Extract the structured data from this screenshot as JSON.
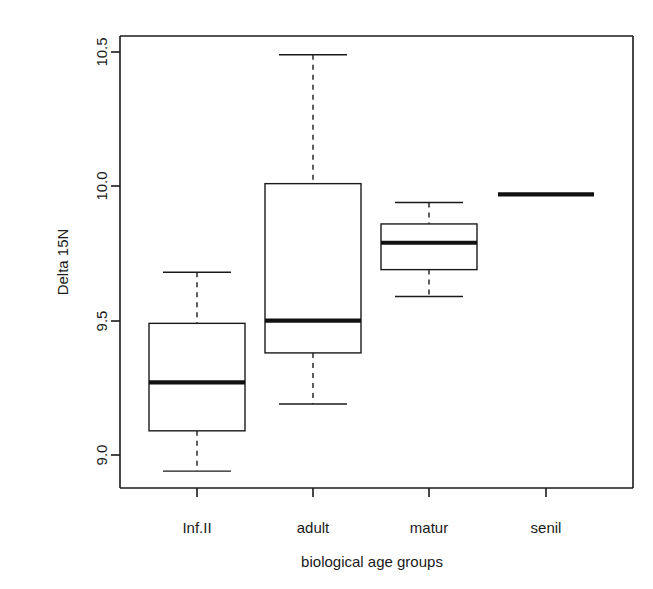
{
  "chart_data": {
    "type": "box",
    "title": "",
    "xlabel": "biological age groups",
    "ylabel": "Delta 15N",
    "categories": [
      "Inf.II",
      "adult",
      "matur",
      "senil"
    ],
    "ylim": [
      8.85,
      10.56
    ],
    "yticks": [
      9.0,
      9.5,
      10.0,
      10.5
    ],
    "ytick_labels": [
      "9.0",
      "9.5",
      "10.0",
      "10.5"
    ],
    "grid": false,
    "legend": null,
    "boxes": [
      {
        "category": "Inf.II",
        "whisker_low": 8.94,
        "q1": 9.09,
        "median": 9.27,
        "q3": 9.49,
        "whisker_high": 9.68,
        "degenerate": false
      },
      {
        "category": "adult",
        "whisker_low": 9.19,
        "q1": 9.38,
        "median": 9.5,
        "q3": 10.01,
        "whisker_high": 10.49,
        "degenerate": false
      },
      {
        "category": "matur",
        "whisker_low": 9.59,
        "q1": 9.69,
        "median": 9.79,
        "q3": 9.86,
        "whisker_high": 9.94,
        "degenerate": false
      },
      {
        "category": "senil",
        "whisker_low": 9.97,
        "q1": 9.97,
        "median": 9.97,
        "q3": 9.97,
        "whisker_high": 9.97,
        "degenerate": true
      }
    ]
  },
  "axes": {
    "y_title": "Delta 15N",
    "x_title": "biological age groups",
    "y_tick_labels": [
      "10.5",
      "10.0",
      "9.5",
      "9.0"
    ],
    "x_tick_labels": [
      "Inf.II",
      "adult",
      "matur",
      "senil"
    ]
  },
  "colors": {
    "foreground": "#1a1a1a",
    "background": "#ffffff",
    "median": "#111111"
  }
}
